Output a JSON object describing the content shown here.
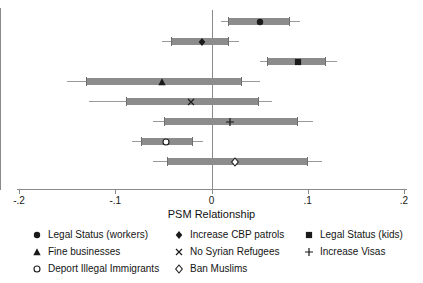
{
  "chart_data": {
    "type": "scatter",
    "title": "",
    "xlabel": "PSM Relationship",
    "ylabel": "",
    "xlim": [
      -0.2,
      0.2
    ],
    "xticks": [
      -0.2,
      -0.1,
      0,
      0.2
    ],
    "xticklabels": [
      "-.2",
      "-.1",
      "0",
      ".1",
      ".2"
    ],
    "xtickvalues": [
      -0.2,
      -0.1,
      0,
      0.1,
      0.2
    ],
    "grid": false,
    "legend_position": "bottom",
    "zero_reference_line": 0,
    "series": [
      {
        "name": "Legal Status (workers)",
        "marker": "filled-circle",
        "estimate": 0.05,
        "ci_inner": [
          0.017,
          0.081
        ],
        "ci_outer": [
          0.01,
          0.092
        ]
      },
      {
        "name": "Increase CBP patrols",
        "marker": "filled-diamond",
        "estimate": -0.01,
        "ci_inner": [
          -0.042,
          0.017
        ],
        "ci_outer": [
          -0.051,
          0.029
        ]
      },
      {
        "name": "Legal Status (kids)",
        "marker": "filled-square",
        "estimate": 0.09,
        "ci_inner": [
          0.058,
          0.118
        ],
        "ci_outer": [
          0.05,
          0.13
        ]
      },
      {
        "name": "Fine businesses",
        "marker": "filled-triangle",
        "estimate": -0.051,
        "ci_inner": [
          -0.13,
          0.031
        ],
        "ci_outer": [
          -0.15,
          0.05
        ]
      },
      {
        "name": "No Syrian Refugees",
        "marker": "cross-x",
        "estimate": -0.021,
        "ci_inner": [
          -0.089,
          0.048
        ],
        "ci_outer": [
          -0.127,
          0.063
        ]
      },
      {
        "name": "Increase Visas",
        "marker": "plus",
        "estimate": 0.019,
        "ci_inner": [
          -0.049,
          0.089
        ],
        "ci_outer": [
          -0.061,
          0.105
        ]
      },
      {
        "name": "Deport Illegal Immigrants",
        "marker": "hollow-circle",
        "estimate": -0.047,
        "ci_inner": [
          -0.073,
          -0.02
        ],
        "ci_outer": [
          -0.083,
          -0.009
        ]
      },
      {
        "name": "Ban Muslims",
        "marker": "hollow-diamond",
        "estimate": 0.024,
        "ci_inner": [
          -0.046,
          0.099
        ],
        "ci_outer": [
          -0.061,
          0.115
        ]
      }
    ]
  },
  "axis": {
    "title": "PSM Relationship",
    "ticks": [
      {
        "label": "-.2",
        "value": -0.2
      },
      {
        "label": "-.1",
        "value": -0.1
      },
      {
        "label": "0",
        "value": 0
      },
      {
        "label": ".1",
        "value": 0.1
      },
      {
        "label": ".2",
        "value": 0.2
      }
    ]
  },
  "legend": {
    "entries": [
      {
        "label": "Legal Status (workers)",
        "marker": "filled-circle"
      },
      {
        "label": "Increase CBP patrols",
        "marker": "filled-diamond"
      },
      {
        "label": "Legal Status (kids)",
        "marker": "filled-square"
      },
      {
        "label": "Fine businesses",
        "marker": "filled-triangle"
      },
      {
        "label": "No Syrian Refugees",
        "marker": "cross-x"
      },
      {
        "label": "Increase Visas",
        "marker": "plus"
      },
      {
        "label": "Deport Illegal Immigrants",
        "marker": "hollow-circle"
      },
      {
        "label": "Ban Muslims",
        "marker": "hollow-diamond"
      }
    ]
  },
  "colors": {
    "marker": "#1a1a1a",
    "ci_band": "#8c8c8c",
    "ci_whisker": "#9a9a9a",
    "axis": "#8a8a8a",
    "background": "#ffffff"
  }
}
